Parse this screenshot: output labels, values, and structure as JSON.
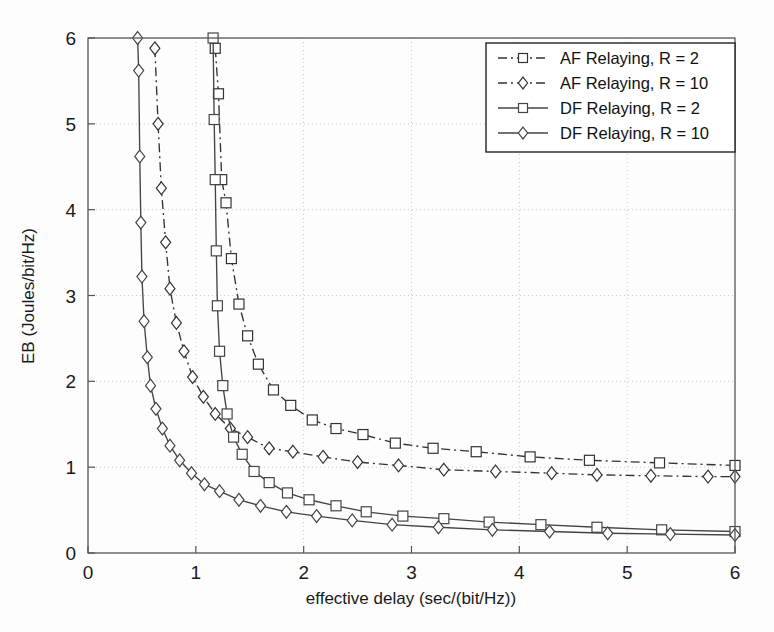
{
  "chart_data": {
    "type": "line",
    "title": "",
    "xlabel": "effective delay (sec/(bit/Hz))",
    "ylabel": "EB (Joules/bit/Hz)",
    "xlim": [
      0,
      6
    ],
    "ylim": [
      0,
      6
    ],
    "xticks": [
      0,
      1,
      2,
      3,
      4,
      5,
      6
    ],
    "yticks": [
      0,
      1,
      2,
      3,
      4,
      5,
      6
    ],
    "xticklabels": [
      "0",
      "1",
      "2",
      "3",
      "4",
      "5",
      "6"
    ],
    "yticklabels": [
      "0",
      "1",
      "2",
      "3",
      "4",
      "5",
      "6"
    ],
    "grid": true,
    "grid_style": "dotted",
    "legend_position": "upper right",
    "series": [
      {
        "name": "AF Relaying, R = 2",
        "linestyle": "dashdot",
        "marker": "square",
        "color": "#333333",
        "points": [
          [
            1.18,
            5.88
          ],
          [
            1.21,
            5.35
          ],
          [
            1.24,
            4.35
          ],
          [
            1.28,
            4.08
          ],
          [
            1.33,
            3.43
          ],
          [
            1.4,
            2.9
          ],
          [
            1.48,
            2.53
          ],
          [
            1.58,
            2.2
          ],
          [
            1.72,
            1.9
          ],
          [
            1.88,
            1.72
          ],
          [
            2.08,
            1.55
          ],
          [
            2.3,
            1.45
          ],
          [
            2.55,
            1.38
          ],
          [
            2.85,
            1.28
          ],
          [
            3.2,
            1.22
          ],
          [
            3.6,
            1.18
          ],
          [
            4.1,
            1.12
          ],
          [
            4.65,
            1.08
          ],
          [
            5.3,
            1.05
          ],
          [
            6.0,
            1.02
          ]
        ]
      },
      {
        "name": "AF Relaying, R = 10",
        "linestyle": "dashdot",
        "marker": "diamond",
        "color": "#333333",
        "points": [
          [
            0.62,
            5.88
          ],
          [
            0.65,
            5.0
          ],
          [
            0.68,
            4.25
          ],
          [
            0.72,
            3.62
          ],
          [
            0.76,
            3.08
          ],
          [
            0.82,
            2.68
          ],
          [
            0.89,
            2.35
          ],
          [
            0.97,
            2.05
          ],
          [
            1.07,
            1.82
          ],
          [
            1.18,
            1.62
          ],
          [
            1.32,
            1.45
          ],
          [
            1.48,
            1.35
          ],
          [
            1.68,
            1.22
          ],
          [
            1.9,
            1.18
          ],
          [
            2.18,
            1.12
          ],
          [
            2.5,
            1.06
          ],
          [
            2.88,
            1.02
          ],
          [
            3.3,
            0.97
          ],
          [
            3.78,
            0.95
          ],
          [
            4.3,
            0.93
          ],
          [
            4.72,
            0.91
          ],
          [
            5.22,
            0.9
          ],
          [
            5.75,
            0.89
          ],
          [
            6.0,
            0.89
          ]
        ]
      },
      {
        "name": "DF Relaying, R = 2",
        "linestyle": "solid",
        "marker": "square",
        "color": "#444444",
        "points": [
          [
            1.16,
            6.0
          ],
          [
            1.17,
            5.05
          ],
          [
            1.18,
            4.35
          ],
          [
            1.19,
            3.52
          ],
          [
            1.2,
            2.88
          ],
          [
            1.22,
            2.35
          ],
          [
            1.25,
            1.95
          ],
          [
            1.29,
            1.62
          ],
          [
            1.35,
            1.35
          ],
          [
            1.43,
            1.15
          ],
          [
            1.54,
            0.95
          ],
          [
            1.68,
            0.82
          ],
          [
            1.85,
            0.7
          ],
          [
            2.05,
            0.62
          ],
          [
            2.3,
            0.55
          ],
          [
            2.58,
            0.48
          ],
          [
            2.92,
            0.43
          ],
          [
            3.3,
            0.4
          ],
          [
            3.72,
            0.36
          ],
          [
            4.2,
            0.33
          ],
          [
            4.72,
            0.3
          ],
          [
            5.32,
            0.27
          ],
          [
            6.0,
            0.25
          ]
        ]
      },
      {
        "name": "DF Relaying, R = 10",
        "linestyle": "solid",
        "marker": "diamond",
        "color": "#444444",
        "points": [
          [
            0.46,
            6.0
          ],
          [
            0.47,
            5.62
          ],
          [
            0.48,
            4.62
          ],
          [
            0.49,
            3.85
          ],
          [
            0.5,
            3.22
          ],
          [
            0.52,
            2.7
          ],
          [
            0.55,
            2.28
          ],
          [
            0.58,
            1.95
          ],
          [
            0.63,
            1.68
          ],
          [
            0.69,
            1.45
          ],
          [
            0.76,
            1.25
          ],
          [
            0.85,
            1.08
          ],
          [
            0.96,
            0.93
          ],
          [
            1.08,
            0.8
          ],
          [
            1.22,
            0.72
          ],
          [
            1.4,
            0.62
          ],
          [
            1.6,
            0.55
          ],
          [
            1.84,
            0.48
          ],
          [
            2.12,
            0.43
          ],
          [
            2.45,
            0.38
          ],
          [
            2.82,
            0.33
          ],
          [
            3.25,
            0.3
          ],
          [
            3.75,
            0.27
          ],
          [
            4.28,
            0.25
          ],
          [
            4.82,
            0.23
          ],
          [
            5.4,
            0.22
          ],
          [
            6.0,
            0.21
          ]
        ]
      }
    ]
  },
  "legend": {
    "items": [
      {
        "label": "AF Relaying, R = 2"
      },
      {
        "label": "AF Relaying, R = 10"
      },
      {
        "label": "DF Relaying, R = 2"
      },
      {
        "label": "DF Relaying, R = 10"
      }
    ]
  }
}
